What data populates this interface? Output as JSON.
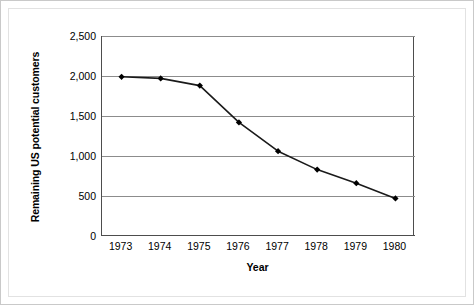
{
  "chart_data": {
    "type": "line",
    "title": "",
    "xlabel": "Year",
    "ylabel": "Remaining US potential customers",
    "categories": [
      "1973",
      "1974",
      "1975",
      "1976",
      "1977",
      "1978",
      "1979",
      "1980"
    ],
    "x": [
      1973,
      1974,
      1975,
      1976,
      1977,
      1978,
      1979,
      1980
    ],
    "values": [
      1990,
      1970,
      1880,
      1420,
      1060,
      830,
      660,
      470
    ],
    "series": [
      {
        "name": "Remaining US potential customers",
        "values": [
          1990,
          1970,
          1880,
          1420,
          1060,
          830,
          660,
          470
        ]
      }
    ],
    "ylim": [
      0,
      2500
    ],
    "yticks": [
      0,
      500,
      1000,
      1500,
      2000,
      2500
    ],
    "ytick_labels": [
      "0",
      "500",
      "1,000",
      "1,500",
      "2,000",
      "2,500"
    ],
    "grid": "horizontal",
    "legend": "none",
    "marker": "filled-diamond",
    "line_color": "#1a1a1a",
    "marker_color": "#000000",
    "gridline_color": "#8c8c8c",
    "axis_color": "#4d4d4d",
    "background_color": "#ffffff"
  }
}
